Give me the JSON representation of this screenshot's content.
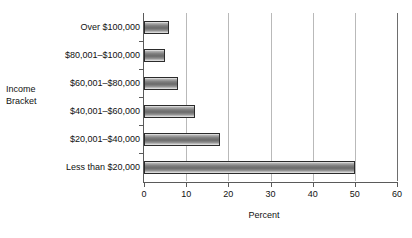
{
  "chart_data": {
    "type": "bar",
    "orientation": "horizontal",
    "title": "",
    "xlabel": "Percent",
    "ylabel": "Income Bracket",
    "categories": [
      "Over $100,000",
      "$80,001–$100,000",
      "$60,001–$80,000",
      "$40,001–$60,000",
      "$20,001–$40,000",
      "Less than $20,000"
    ],
    "values": [
      6,
      5,
      8,
      12,
      18,
      50
    ],
    "xlim": [
      0,
      60
    ],
    "xticks": [
      0,
      10,
      20,
      30,
      40,
      50,
      60
    ],
    "xtick_labels": [
      "0",
      "10",
      "20",
      "30",
      "40",
      "50",
      "60"
    ],
    "grid": "vertical",
    "legend": "none",
    "bar_color": "#6f6f6f",
    "bar_edge_color": "#2b2b2b",
    "grid_color": "#b9b9b9",
    "axis_color": "#5a5a5a",
    "background": "#ffffff"
  },
  "ylabel_lines": [
    "Income",
    "Bracket"
  ]
}
